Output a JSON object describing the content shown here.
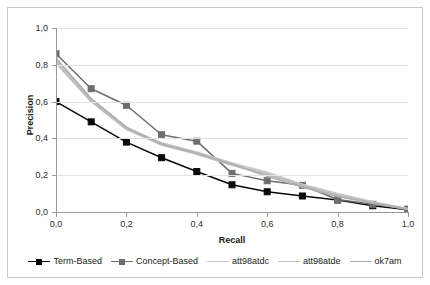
{
  "chart_data": {
    "type": "line",
    "title": "",
    "xlabel": "Recall",
    "ylabel": "Precision",
    "xlim": [
      0.0,
      1.0
    ],
    "ylim": [
      0.0,
      1.0
    ],
    "grid": true,
    "legend_position": "bottom",
    "x": [
      0.0,
      0.1,
      0.2,
      0.3,
      0.4,
      0.5,
      0.6,
      0.7,
      0.8,
      0.9,
      1.0
    ],
    "xtick_labels": [
      "0,0",
      "0,2",
      "0,4",
      "0,6",
      "0,8",
      "1,0"
    ],
    "xtick_values": [
      0.0,
      0.2,
      0.4,
      0.6,
      0.8,
      1.0
    ],
    "ytick_labels": [
      "0,0",
      "0,2",
      "0,4",
      "0,6",
      "0,8",
      "1,0"
    ],
    "ytick_values": [
      0.0,
      0.2,
      0.4,
      0.6,
      0.8,
      1.0
    ],
    "series": [
      {
        "name": "Term-Based",
        "color": "#0a0a0a",
        "marker": "square",
        "values": [
          0.6,
          0.49,
          0.38,
          0.295,
          0.22,
          0.148,
          0.11,
          0.087,
          0.065,
          0.034,
          0.012
        ]
      },
      {
        "name": "Concept-Based",
        "color": "#6e6e6e",
        "marker": "square",
        "values": [
          0.86,
          0.67,
          0.58,
          0.42,
          0.385,
          0.21,
          0.17,
          0.145,
          0.068,
          0.042,
          0.016
        ]
      },
      {
        "name": "att98atdc",
        "color": "#c9c9c9",
        "marker": "none",
        "values": [
          0.825,
          0.61,
          0.455,
          0.375,
          0.325,
          0.265,
          0.215,
          0.15,
          0.1,
          0.055,
          0.018
        ]
      },
      {
        "name": "att98atde",
        "color": "#bdbdbd",
        "marker": "none",
        "values": [
          0.81,
          0.6,
          0.45,
          0.365,
          0.315,
          0.255,
          0.205,
          0.145,
          0.092,
          0.05,
          0.016
        ]
      },
      {
        "name": "ok7am",
        "color": "#b0b0b0",
        "marker": "none",
        "values": [
          0.835,
          0.615,
          0.46,
          0.37,
          0.32,
          0.26,
          0.195,
          0.135,
          0.085,
          0.048,
          0.015
        ]
      }
    ]
  },
  "legend": {
    "items": [
      {
        "label": "Term-Based"
      },
      {
        "label": "Concept-Based"
      },
      {
        "label": "att98atdc"
      },
      {
        "label": "att98atde"
      },
      {
        "label": "ok7am"
      }
    ]
  }
}
